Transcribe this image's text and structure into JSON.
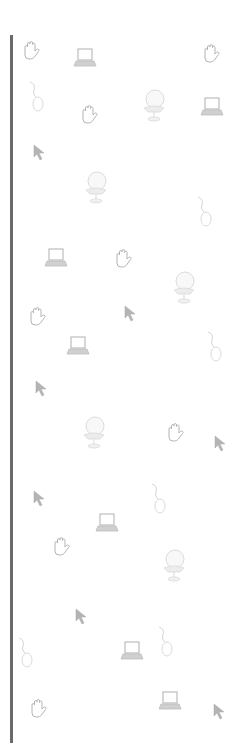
{
  "background": {
    "color": "#ffffff",
    "bar_color": "#6a6a6a",
    "icon_color": "#8a8a8a",
    "icons": [
      {
        "type": "hand",
        "x": 20,
        "y": 40
      },
      {
        "type": "laptop",
        "x": 73,
        "y": 47
      },
      {
        "type": "hand",
        "x": 200,
        "y": 43
      },
      {
        "type": "mouse",
        "x": 26,
        "y": 80
      },
      {
        "type": "hand",
        "x": 78,
        "y": 104
      },
      {
        "type": "computer",
        "x": 140,
        "y": 88
      },
      {
        "type": "laptop",
        "x": 200,
        "y": 96
      },
      {
        "type": "cursor",
        "x": 33,
        "y": 144
      },
      {
        "type": "computer",
        "x": 82,
        "y": 170
      },
      {
        "type": "mouse",
        "x": 194,
        "y": 195
      },
      {
        "type": "laptop",
        "x": 44,
        "y": 247
      },
      {
        "type": "hand",
        "x": 112,
        "y": 248
      },
      {
        "type": "computer",
        "x": 170,
        "y": 270
      },
      {
        "type": "hand",
        "x": 26,
        "y": 306
      },
      {
        "type": "cursor",
        "x": 124,
        "y": 305
      },
      {
        "type": "laptop",
        "x": 66,
        "y": 335
      },
      {
        "type": "mouse",
        "x": 204,
        "y": 330
      },
      {
        "type": "cursor",
        "x": 35,
        "y": 380
      },
      {
        "type": "computer",
        "x": 80,
        "y": 415
      },
      {
        "type": "hand",
        "x": 164,
        "y": 422
      },
      {
        "type": "cursor",
        "x": 214,
        "y": 435
      },
      {
        "type": "mouse",
        "x": 148,
        "y": 482
      },
      {
        "type": "cursor",
        "x": 33,
        "y": 490
      },
      {
        "type": "laptop",
        "x": 95,
        "y": 512
      },
      {
        "type": "hand",
        "x": 50,
        "y": 536
      },
      {
        "type": "computer",
        "x": 160,
        "y": 548
      },
      {
        "type": "cursor",
        "x": 75,
        "y": 608
      },
      {
        "type": "mouse",
        "x": 155,
        "y": 625
      },
      {
        "type": "mouse",
        "x": 15,
        "y": 636
      },
      {
        "type": "laptop",
        "x": 120,
        "y": 640
      },
      {
        "type": "hand",
        "x": 27,
        "y": 698
      },
      {
        "type": "laptop",
        "x": 158,
        "y": 690
      },
      {
        "type": "cursor",
        "x": 213,
        "y": 703
      }
    ]
  }
}
